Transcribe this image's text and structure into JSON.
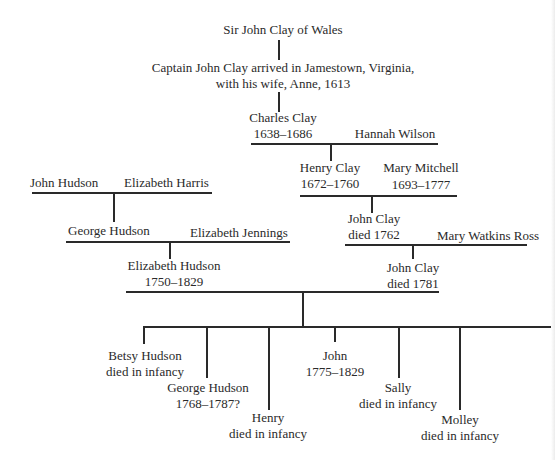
{
  "diagram": {
    "type": "family-tree",
    "generations": {
      "g1": {
        "name": "Sir John Clay of Wales"
      },
      "g2": {
        "line1": "Captain John Clay arrived in Jamestown, Virginia,",
        "line2": "with his wife, Anne, 1613"
      },
      "g3": {
        "name": "Charles Clay",
        "dates": "1638–1686",
        "spouse": "Hannah Wilson"
      },
      "g4": {
        "name": "Henry Clay",
        "dates": "1672–1760",
        "spouse": "Mary Mitchell",
        "spouse_dates": "1693–1777"
      },
      "g5": {
        "name": "John Clay",
        "dates": "died 1762",
        "spouse": "Mary Watkins Ross"
      },
      "g6": {
        "name": "John Clay",
        "dates": "died 1781"
      }
    },
    "hudson": {
      "parents": {
        "father": "John Hudson",
        "mother": "Elizabeth Harris"
      },
      "son": {
        "name": "George Hudson",
        "spouse": "Elizabeth Jennings"
      },
      "daughter": {
        "name": "Elizabeth Hudson",
        "dates": "1750–1829"
      }
    },
    "children": [
      {
        "name": "Betsy Hudson",
        "note": "died in infancy"
      },
      {
        "name": "George Hudson",
        "note": "1768–1787?"
      },
      {
        "name": "Henry",
        "note": "died in infancy"
      },
      {
        "name": "John",
        "note": "1775–1829"
      },
      {
        "name": "Sally",
        "note": "died in infancy"
      },
      {
        "name": "Molley",
        "note": "died in infancy"
      }
    ]
  }
}
